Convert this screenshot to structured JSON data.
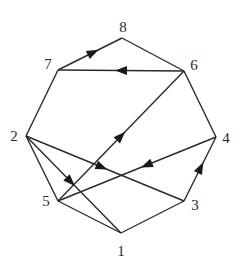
{
  "diagram": {
    "type": "graph",
    "nodes": [
      {
        "id": "1",
        "label": "1"
      },
      {
        "id": "2",
        "label": "2"
      },
      {
        "id": "3",
        "label": "3"
      },
      {
        "id": "4",
        "label": "4"
      },
      {
        "id": "5",
        "label": "5"
      },
      {
        "id": "6",
        "label": "6"
      },
      {
        "id": "7",
        "label": "7"
      },
      {
        "id": "8",
        "label": "8"
      }
    ],
    "edges": [
      {
        "from": "1",
        "to": "5",
        "directed": false
      },
      {
        "from": "1",
        "to": "3",
        "directed": false
      },
      {
        "from": "2",
        "to": "1",
        "directed": true
      },
      {
        "from": "2",
        "to": "5",
        "directed": false
      },
      {
        "from": "2",
        "to": "7",
        "directed": false
      },
      {
        "from": "2",
        "to": "3",
        "directed": true
      },
      {
        "from": "7",
        "to": "8",
        "directed": true
      },
      {
        "from": "8",
        "to": "6",
        "directed": false
      },
      {
        "from": "6",
        "to": "7",
        "directed": true
      },
      {
        "from": "6",
        "to": "4",
        "directed": false
      },
      {
        "from": "3",
        "to": "4",
        "directed": true
      },
      {
        "from": "5",
        "to": "6",
        "directed": true
      },
      {
        "from": "4",
        "to": "5",
        "directed": true
      }
    ]
  }
}
